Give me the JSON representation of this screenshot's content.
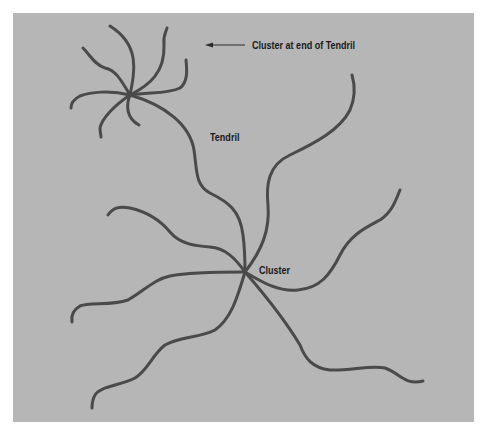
{
  "diagram": {
    "labels": {
      "cluster_end": "Cluster at end of Tendril",
      "tendril": "Tendril",
      "cluster": "Cluster"
    },
    "colors": {
      "background": "#b6b6b6",
      "stroke": "#4a4a4a",
      "page": "#ffffff",
      "text": "#1a1a1a"
    },
    "nodes": [
      {
        "id": "end-cluster",
        "label_ref": "cluster_end",
        "x": 130,
        "y": 95
      },
      {
        "id": "main-cluster",
        "label_ref": "cluster",
        "x": 245,
        "y": 272
      }
    ],
    "edges": [
      {
        "id": "tendril",
        "from": "end-cluster",
        "to": "main-cluster",
        "label_ref": "tendril"
      }
    ],
    "arrow": {
      "from_x": 245,
      "from_y": 45,
      "to_x": 206,
      "to_y": 45,
      "points_to": "end-cluster"
    }
  }
}
